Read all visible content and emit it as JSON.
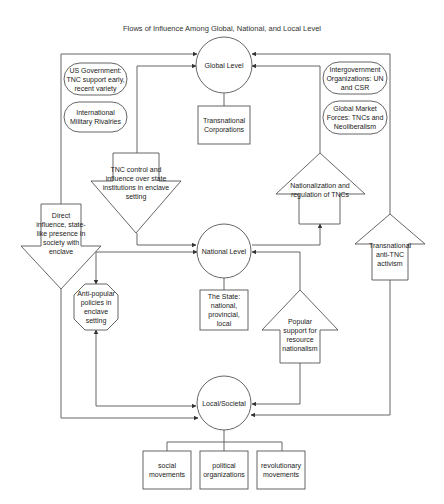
{
  "title": "Flows of Influence Among Global, National, and Local Level",
  "levels": {
    "global": "Global Level",
    "national": "National Level",
    "local": "Local/Societal"
  },
  "boxes": {
    "transnational_corporations": "Transnational Corporations",
    "the_state": "The State: national, provincial, local",
    "social_movements": "social movements",
    "political_organizations": "political organizations",
    "revolutionary_movements": "revolutionary movements"
  },
  "rounded": {
    "us_government": "US Government: TNC support early, recent variety",
    "military_rivalries": "International Military Rivalries",
    "intergovernment": "Intergovernment Organizations: UN and CSR",
    "market_forces": "Global Market Forces: TNCs and Neoliberalism"
  },
  "arrows": {
    "tnc_control": "TNC control and influence over state institutions in enclave setting",
    "direct_influence": "Direct influence, state-like presence in society with enclave",
    "nationalization": "Nationalization and regulation of TNCs",
    "transnational_activism": "Transnational anti-TNC activism",
    "popular_support": "Popular support for resource nationalism"
  },
  "octagon": {
    "anti_popular": "Anti-popular policies in enclave setting"
  },
  "colors": {
    "stroke": "#555555",
    "background": "#ffffff",
    "text": "#222222"
  }
}
